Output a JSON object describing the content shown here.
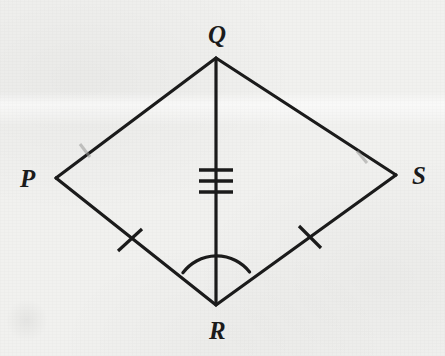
{
  "figure": {
    "kind": "geometry-diagram",
    "shape_name": "kite PQRS",
    "background_color": "#f1f1ef",
    "stroke_color": "#1b1b1b",
    "canvas": {
      "width": 445,
      "height": 356
    },
    "vertices": [
      {
        "id": "Q",
        "label": "Q",
        "x": 216,
        "y": 58,
        "label_x": 208,
        "label_y": 22,
        "position": "top"
      },
      {
        "id": "P",
        "label": "P",
        "x": 56,
        "y": 178,
        "label_x": 20,
        "label_y": 166,
        "position": "left"
      },
      {
        "id": "S",
        "label": "S",
        "x": 396,
        "y": 175,
        "label_x": 412,
        "label_y": 163,
        "position": "right"
      },
      {
        "id": "R",
        "label": "R",
        "x": 216,
        "y": 305,
        "label_x": 209,
        "label_y": 318,
        "position": "bottom"
      }
    ],
    "segments": [
      {
        "id": "PQ",
        "from": "P",
        "to": "Q",
        "stroke_width": 3.2,
        "tick_marks": 1,
        "tick_style": "faded"
      },
      {
        "id": "QS",
        "from": "Q",
        "to": "S",
        "stroke_width": 3.2,
        "tick_marks": 1,
        "tick_style": "faded"
      },
      {
        "id": "PR",
        "from": "P",
        "to": "R",
        "stroke_width": 3.2,
        "tick_marks": 1,
        "tick_style": "solid"
      },
      {
        "id": "RS",
        "from": "R",
        "to": "S",
        "stroke_width": 3.2,
        "tick_marks": 1,
        "tick_style": "solid"
      },
      {
        "id": "QR",
        "from": "Q",
        "to": "R",
        "stroke_width": 3.2,
        "tick_marks": 3,
        "tick_style": "solid",
        "is_diagonal": true
      }
    ],
    "tick_marks": [
      {
        "id": "tick-qr-1",
        "on_segment": "QR",
        "cx": 216,
        "cy": 170,
        "half_length": 17,
        "orientation": "horizontal",
        "style": "solid"
      },
      {
        "id": "tick-qr-2",
        "on_segment": "QR",
        "cx": 216,
        "cy": 181,
        "half_length": 17,
        "orientation": "horizontal",
        "style": "solid"
      },
      {
        "id": "tick-qr-3",
        "on_segment": "QR",
        "cx": 216,
        "cy": 192,
        "half_length": 17,
        "orientation": "horizontal",
        "style": "solid"
      },
      {
        "id": "tick-pr-1",
        "on_segment": "PR",
        "cx": 130,
        "cy": 240,
        "half_length": 15,
        "orientation": "perpendicular",
        "style": "solid"
      },
      {
        "id": "tick-rs-1",
        "on_segment": "RS",
        "cx": 310,
        "cy": 237,
        "half_length": 15,
        "orientation": "perpendicular",
        "style": "solid"
      },
      {
        "id": "tick-pq-1",
        "on_segment": "PQ",
        "cx": 85,
        "cy": 150,
        "half_length": 7,
        "orientation": "perpendicular",
        "style": "faded"
      },
      {
        "id": "tick-qs-1",
        "on_segment": "QS",
        "cx": 362,
        "cy": 157,
        "half_length": 7,
        "orientation": "perpendicular",
        "style": "faded"
      }
    ],
    "angle_arcs": [
      {
        "id": "arc-at-R",
        "at_vertex": "R",
        "radius": 42,
        "between_segments": [
          "PR",
          "RS"
        ],
        "arc_count": 1
      }
    ]
  }
}
